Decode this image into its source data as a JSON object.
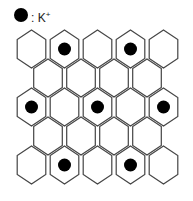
{
  "legend": {
    "marker": "filled-circle",
    "separator": ":",
    "ion": "K",
    "charge": "+"
  },
  "lattice": {
    "shape": "hexagonal-grid",
    "hex_orientation": "pointy-top",
    "rows": [
      {
        "count": 5,
        "dots_at": [
          2,
          4
        ]
      },
      {
        "count": 4,
        "dots_at": []
      },
      {
        "count": 5,
        "dots_at": [
          1,
          3,
          5
        ]
      },
      {
        "count": 4,
        "dots_at": []
      },
      {
        "count": 5,
        "dots_at": [
          2,
          4
        ]
      }
    ],
    "line_color": "#444444",
    "dot_color": "#000000"
  }
}
